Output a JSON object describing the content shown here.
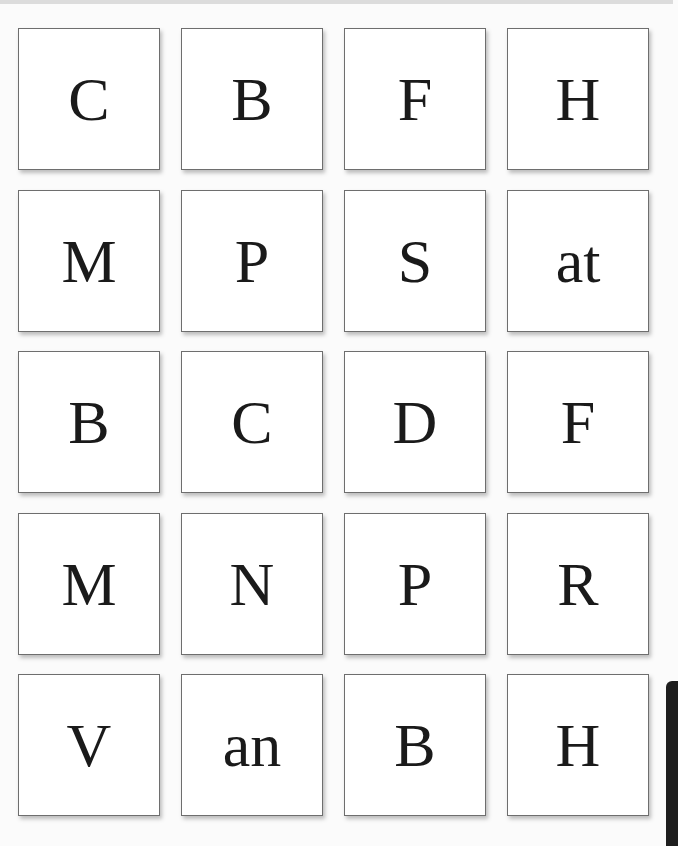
{
  "cards": [
    {
      "text": "C"
    },
    {
      "text": "B"
    },
    {
      "text": "F"
    },
    {
      "text": "H"
    },
    {
      "text": "M"
    },
    {
      "text": "P"
    },
    {
      "text": "S"
    },
    {
      "text": "at"
    },
    {
      "text": "B"
    },
    {
      "text": "C"
    },
    {
      "text": "D"
    },
    {
      "text": "F"
    },
    {
      "text": "M"
    },
    {
      "text": "N"
    },
    {
      "text": "P"
    },
    {
      "text": "R"
    },
    {
      "text": "V"
    },
    {
      "text": "an"
    },
    {
      "text": "B"
    },
    {
      "text": "H"
    }
  ]
}
